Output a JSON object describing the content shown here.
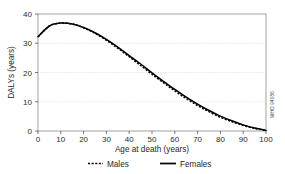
{
  "chart_data": {
    "type": "line",
    "title": "",
    "xlabel": "Age at death (years)",
    "ylabel": "DALYs (years)",
    "xlim": [
      0,
      100
    ],
    "ylim": [
      0,
      40
    ],
    "xticks": [
      "0",
      "10",
      "20",
      "30",
      "40",
      "50",
      "60",
      "70",
      "80",
      "90",
      "100"
    ],
    "yticks": [
      "0",
      "10",
      "20",
      "30",
      "40"
    ],
    "grid": "horizontal dotted at 10, 20, 30",
    "legend_position": "below-axis",
    "x": [
      0,
      5,
      10,
      15,
      20,
      25,
      30,
      35,
      40,
      45,
      50,
      55,
      60,
      65,
      70,
      75,
      80,
      85,
      90,
      95,
      100
    ],
    "series": [
      {
        "name": "Males",
        "style": "dashed",
        "color": "#000000",
        "values": [
          32.2,
          35.9,
          36.9,
          36.6,
          35.3,
          33.4,
          31.0,
          28.3,
          25.4,
          22.4,
          19.4,
          16.5,
          13.7,
          11.1,
          8.7,
          6.6,
          4.7,
          3.2,
          1.9,
          0.9,
          0.2
        ]
      },
      {
        "name": "Females",
        "style": "solid",
        "color": "#000000",
        "values": [
          32.2,
          35.9,
          36.9,
          36.6,
          35.4,
          33.6,
          31.3,
          28.7,
          25.8,
          22.9,
          19.9,
          17.0,
          14.2,
          11.6,
          9.2,
          7.0,
          5.1,
          3.5,
          2.1,
          1.0,
          0.2
        ]
      }
    ],
    "annotations": [
      {
        "name": "credit",
        "text": "WHO 94086",
        "position": "right-edge-vertical"
      }
    ]
  },
  "axes": {
    "ylabel": "DALYs (years)",
    "xlabel": "Age at death (years)",
    "yticks": [
      "40",
      "30",
      "20",
      "10",
      "0"
    ],
    "xticks": [
      "0",
      "10",
      "20",
      "30",
      "40",
      "50",
      "60",
      "70",
      "80",
      "90",
      "100"
    ]
  },
  "legend": {
    "items": [
      {
        "label": "Males",
        "style": "dashed"
      },
      {
        "label": "Females",
        "style": "solid"
      }
    ]
  },
  "credit": {
    "text": "WHO 94086"
  }
}
